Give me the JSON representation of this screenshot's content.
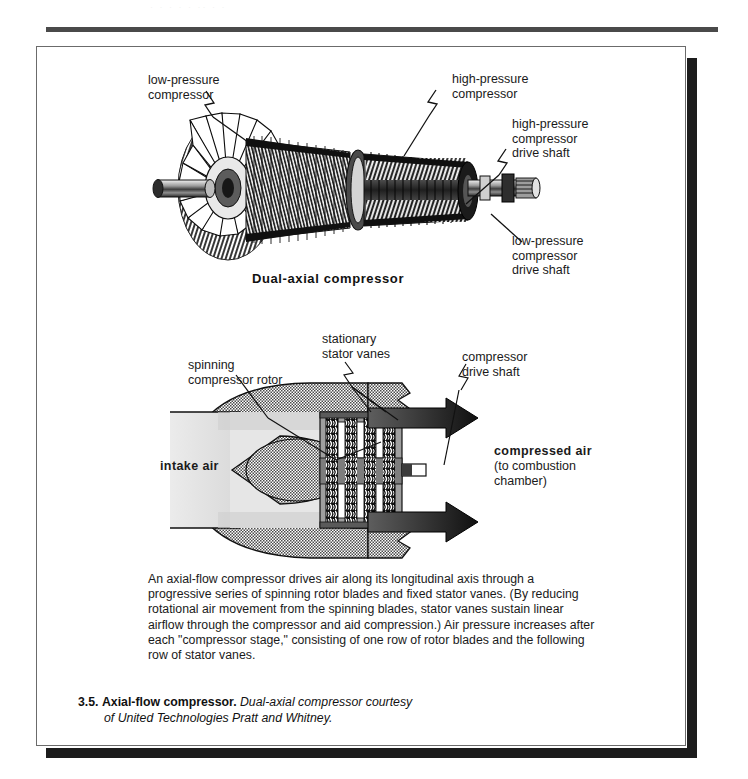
{
  "page": {
    "bleed_text": "· · ·   ·  ·   ·· ·   ·"
  },
  "figure": {
    "top_diagram": {
      "title": "Dual-axial  compressor",
      "labels": [
        {
          "id": "low-pressure-compressor",
          "text": "low-pressure\ncompressor"
        },
        {
          "id": "high-pressure-compressor",
          "text": "high-pressure\ncompressor"
        },
        {
          "id": "high-pressure-compressor-drive-shaft",
          "text": "high-pressure\ncompressor\ndrive shaft"
        },
        {
          "id": "low-pressure-compressor-drive-shaft",
          "text": "low-pressure\ncompressor\ndrive shaft"
        }
      ]
    },
    "bottom_diagram": {
      "labels": [
        {
          "id": "spinning-compressor-rotor",
          "text": "spinning\ncompressor  rotor"
        },
        {
          "id": "stationary-stator-vanes",
          "text": "stationary\nstator vanes"
        },
        {
          "id": "compressor-drive-shaft",
          "text": "compressor\ndrive shaft"
        },
        {
          "id": "intake-air",
          "text": "intake air"
        },
        {
          "id": "compressed-air",
          "text": "compressed  air"
        },
        {
          "id": "compressed-air-sub",
          "text": "(to combustion\nchamber)"
        }
      ]
    },
    "body_text": "An axial-flow compressor drives air along its longitudinal axis through a progressive series of spinning rotor blades and fixed stator vanes. (By reducing rotational air movement from the spinning blades, stator vanes sustain linear airflow through the compressor and aid compression.) Air pressure increases after each \"compressor stage,\" consisting of one row of rotor blades and the following row of stator vanes.",
    "caption": {
      "number": "3.5.",
      "title": "Axial-flow compressor.",
      "source_line1": "Dual-axial compressor courtesy",
      "source_line2": "of United Technologies Pratt and Whitney."
    }
  },
  "colors": {
    "ink": "#1a1a1a",
    "rule": "#4a4a4a",
    "shadow": "#1c1c1c",
    "frame": "#6b6b6b",
    "mid_gray": "#8c8c8c",
    "light_gray": "#d8d8d8",
    "dark_fill": "#3a3a3a"
  }
}
